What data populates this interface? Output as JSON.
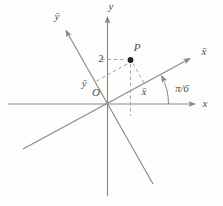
{
  "figure": {
    "description_title": "Rotation of axes diagram",
    "axes": {
      "x_label": "x",
      "y_label": "y",
      "xbar_label": "x̄",
      "ybar_label": "ȳ",
      "origin_label": "O"
    },
    "point": {
      "label": "P",
      "y_value_label": "2",
      "xbar_coord_label": "x̄",
      "ybar_coord_label": "ȳ"
    },
    "angle_label": "π/6",
    "colors": {
      "background": "#fdfdfc",
      "axis": "#8a8a8a",
      "dashed": "#9a9a9a",
      "text": "#4d4d4d",
      "point": "#222222"
    }
  }
}
